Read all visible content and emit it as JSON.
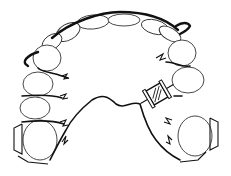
{
  "figure": {
    "components": [
      "acrylic-baseplate",
      "labial-bow",
      "expansion-screw",
      "molar-clasps",
      "teeth"
    ]
  }
}
